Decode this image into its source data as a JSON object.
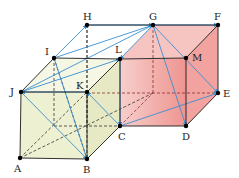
{
  "diagram": {
    "type": "geometry-two-cubes",
    "colors": {
      "left_face_fill": "#eef0d2",
      "right_face_fill": "#f2a3a0",
      "right_face_light": "#f6c5c2",
      "edge": "#1a1a1a",
      "hidden_edge_left": "#333333",
      "hidden_edge_right": "#8a3030",
      "vector": "#3a8fd0",
      "vertex": "#000000"
    },
    "points": {
      "A": {
        "x": 20,
        "y": 158,
        "label": "A",
        "lx": 14,
        "ly": 172
      },
      "B": {
        "x": 87,
        "y": 159,
        "label": "B",
        "lx": 83,
        "ly": 173
      },
      "C": {
        "x": 120,
        "y": 126,
        "label": "C",
        "lx": 118,
        "ly": 140
      },
      "D": {
        "x": 186,
        "y": 126,
        "label": "D",
        "lx": 182,
        "ly": 140
      },
      "E": {
        "x": 218,
        "y": 93,
        "label": "E",
        "lx": 223,
        "ly": 97
      },
      "F": {
        "x": 218,
        "y": 25,
        "label": "F",
        "lx": 214,
        "ly": 20
      },
      "G": {
        "x": 153,
        "y": 25,
        "label": "G",
        "lx": 149,
        "ly": 20
      },
      "H": {
        "x": 87,
        "y": 25,
        "label": "H",
        "lx": 83,
        "ly": 20
      },
      "I": {
        "x": 54,
        "y": 58,
        "label": "I",
        "lx": 45,
        "ly": 55
      },
      "J": {
        "x": 21,
        "y": 92,
        "label": "J",
        "lx": 10,
        "ly": 95
      },
      "K": {
        "x": 87,
        "y": 92,
        "label": "K",
        "lx": 76,
        "ly": 89
      },
      "L": {
        "x": 120,
        "y": 59,
        "label": "L",
        "lx": 115,
        "ly": 53
      },
      "M": {
        "x": 186,
        "y": 58,
        "label": "M",
        "lx": 192,
        "ly": 61
      }
    },
    "solid_edges": [
      [
        "A",
        "B"
      ],
      [
        "B",
        "K"
      ],
      [
        "K",
        "J"
      ],
      [
        "J",
        "A"
      ],
      [
        "J",
        "I"
      ],
      [
        "I",
        "L"
      ],
      [
        "L",
        "K"
      ],
      [
        "B",
        "C"
      ],
      [
        "C",
        "L"
      ],
      [
        "C",
        "D"
      ],
      [
        "D",
        "M"
      ],
      [
        "M",
        "L"
      ],
      [
        "D",
        "E"
      ],
      [
        "E",
        "F"
      ],
      [
        "F",
        "M"
      ],
      [
        "G",
        "F"
      ],
      [
        "H",
        "G"
      ]
    ],
    "hidden_edges_left": [
      [
        "A",
        "K"
      ],
      [
        "I",
        "B"
      ],
      [
        "H",
        "B"
      ]
    ],
    "hidden_edges": [
      [
        "K",
        "C"
      ],
      [
        "K",
        "E"
      ],
      [
        "C",
        "G"
      ],
      [
        "H",
        "C"
      ]
    ],
    "vectors": [
      {
        "from": "I",
        "to": "H"
      },
      {
        "from": "I",
        "to": "G"
      },
      {
        "from": "H",
        "to": "G"
      },
      {
        "from": "G",
        "to": "F"
      },
      {
        "from": "J",
        "to": "L"
      },
      {
        "from": "J",
        "to": "G"
      },
      {
        "from": "I",
        "to": "B"
      },
      {
        "from": "K",
        "to": "J"
      },
      {
        "from": "J",
        "to": "B"
      },
      {
        "from": "C",
        "to": "K"
      },
      {
        "from": "G",
        "to": "L"
      },
      {
        "from": "G",
        "to": "D"
      },
      {
        "from": "G",
        "to": "E"
      },
      {
        "from": "C",
        "to": "E"
      },
      {
        "from": "L",
        "to": "C"
      }
    ]
  }
}
